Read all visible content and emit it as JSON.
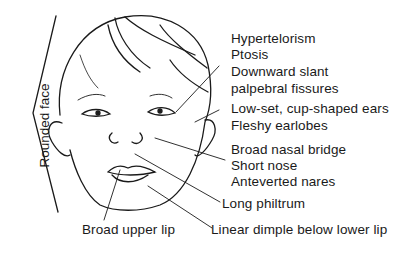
{
  "diagram": {
    "side_label": "Rounded face",
    "labels": {
      "eyes": [
        "Hypertelorism",
        "Ptosis",
        "Downward slant",
        "palpebral fissures"
      ],
      "ears": [
        "Low-set, cup-shaped ears",
        "Fleshy earlobes"
      ],
      "nose": [
        "Broad nasal bridge",
        "Short nose",
        "Anteverted nares"
      ],
      "philtrum": "Long philtrum",
      "upper_lip": "Broad upper lip",
      "lower_lip": "Linear dimple below lower lip"
    },
    "line_color": "#1a1a1a"
  }
}
